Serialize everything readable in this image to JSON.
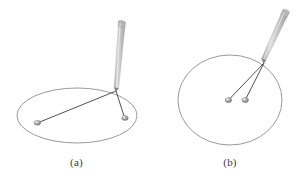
{
  "figure": {
    "background_color": "#ffffff",
    "width": 307,
    "height": 178,
    "curve_color": "#8c8c8c",
    "string_color": "#3c3c3c",
    "pin_color": "#9a9a9a",
    "pin_highlight_color": "#d8d8d8",
    "pencil_body_color": "#c9c9c9",
    "pencil_shade_color": "#9d9d9d",
    "pencil_tip_color": "#8a8a8a",
    "caption_color": "#3a3a3a"
  },
  "panels": [
    {
      "id": "a",
      "caption": "(a)",
      "shape_type": "ellipse",
      "shape": {
        "center_x": 77,
        "center_y": 115.5,
        "radius_x": 60,
        "radius_y": 27.5
      },
      "pins": [
        {
          "label": "left-pin",
          "x": 37,
          "y": 123
        },
        {
          "label": "right-pin",
          "x": 125,
          "y": 118
        }
      ],
      "pencil_tip": {
        "x": 116,
        "y": 91
      },
      "pencil": {
        "tip_x": 116,
        "tip_y": 91,
        "top_x": 122,
        "top_y": 20,
        "width": 7
      },
      "strings": [
        {
          "from": "pencil_tip",
          "to": "left-pin"
        },
        {
          "from": "pencil_tip",
          "to": "right-pin"
        }
      ]
    },
    {
      "id": "b",
      "caption": "(b)",
      "shape_type": "circle",
      "shape": {
        "center_x": 230,
        "center_y": 100,
        "radius_x": 52,
        "radius_y": 45
      },
      "pins": [
        {
          "label": "left-pin",
          "x": 228,
          "y": 100
        },
        {
          "label": "right-pin",
          "x": 245,
          "y": 100
        }
      ],
      "pencil_tip": {
        "x": 264,
        "y": 63
      },
      "pencil": {
        "tip_x": 264,
        "tip_y": 63,
        "top_x": 286,
        "top_y": 9,
        "width": 7
      },
      "strings": [
        {
          "from": "pencil_tip",
          "to": "left-pin"
        },
        {
          "from": "pencil_tip",
          "to": "right-pin"
        }
      ]
    }
  ]
}
